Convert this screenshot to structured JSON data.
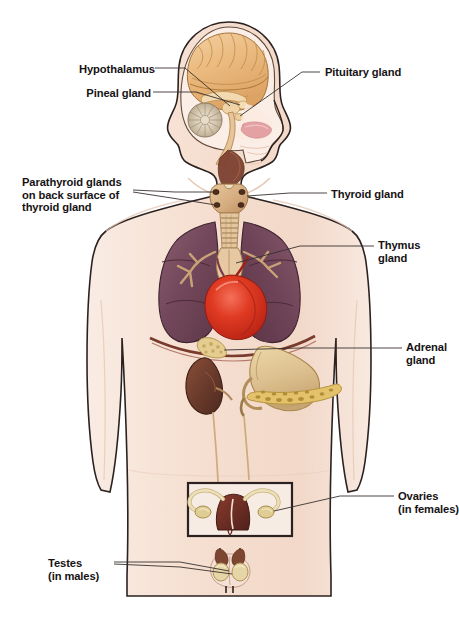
{
  "figure": {
    "background_color": "#ffffff",
    "body_fill": "#f6e2d6",
    "body_outline": "#2b2220",
    "leader_line_color": "#39312f",
    "label_color": "#161214"
  },
  "labels": [
    {
      "name": "hypothalamus",
      "text": "Hypothalamus",
      "side": "left",
      "x": 79,
      "y": 63,
      "width": 72,
      "align": "right"
    },
    {
      "name": "pineal-gland",
      "text": "Pineal gland",
      "side": "left",
      "x": 76,
      "y": 87,
      "width": 75,
      "align": "right"
    },
    {
      "name": "pituitary-gland",
      "text": "Pituitary gland",
      "side": "right",
      "x": 325,
      "y": 66,
      "width": 92,
      "align": "left"
    },
    {
      "name": "parathyroid-glands",
      "text": "Parathyroid glands\non back surface of\nthyroid gland",
      "side": "left",
      "x": 22,
      "y": 176,
      "width": 108,
      "align": "left"
    },
    {
      "name": "thyroid-gland",
      "text": "Thyroid gland",
      "side": "right",
      "x": 331,
      "y": 188,
      "width": 90,
      "align": "left"
    },
    {
      "name": "thymus-gland",
      "text": "Thymus\ngland",
      "side": "right",
      "x": 378,
      "y": 239,
      "width": 52,
      "align": "left"
    },
    {
      "name": "adrenal-gland",
      "text": "Adrenal\ngland",
      "side": "right",
      "x": 406,
      "y": 341,
      "width": 50,
      "align": "left"
    },
    {
      "name": "ovaries",
      "text": "Ovaries\n(in females)",
      "side": "right",
      "x": 398,
      "y": 490,
      "width": 61,
      "align": "left"
    },
    {
      "name": "testes",
      "text": "Testes\n(in males)",
      "side": "left",
      "x": 48,
      "y": 557,
      "width": 62,
      "align": "left"
    }
  ],
  "organs": [
    {
      "name": "brain-cerebrum",
      "label": "Cerebrum",
      "color": "#edb97f"
    },
    {
      "name": "brain-cerebellum",
      "label": "Cerebellum",
      "color": "#d9cdb8"
    },
    {
      "name": "brainstem",
      "label": "Brain stem",
      "color": "#e8c49a"
    },
    {
      "name": "nasal-cavity",
      "label": "Nasal cavity",
      "color": "#e8a8a8"
    },
    {
      "name": "thyroid-gland-organ",
      "label": "Thyroid gland",
      "color": "#d9b184"
    },
    {
      "name": "parathyroid-glands-organ",
      "label": "Parathyroid glands",
      "color": "#5c3b2a"
    },
    {
      "name": "trachea",
      "label": "Trachea",
      "color": "#e2c49e"
    },
    {
      "name": "lung-left",
      "label": "Left lung",
      "color": "#74485c"
    },
    {
      "name": "lung-right",
      "label": "Right lung",
      "color": "#6e4357"
    },
    {
      "name": "heart",
      "label": "Heart",
      "color": "#d62f1e"
    },
    {
      "name": "thymus-gland-organ",
      "label": "Thymus gland",
      "color": "#e2c49e"
    },
    {
      "name": "bronchi",
      "label": "Bronchi",
      "color": "#c8a178"
    },
    {
      "name": "diaphragm",
      "label": "Diaphragm",
      "color": "#7a3a2c"
    },
    {
      "name": "stomach",
      "label": "Stomach",
      "color": "#ddc08f"
    },
    {
      "name": "pancreas",
      "label": "Pancreas",
      "color": "#e2c068"
    },
    {
      "name": "kidney",
      "label": "Kidney",
      "color": "#6b3b2c"
    },
    {
      "name": "adrenal-gland-organ",
      "label": "Adrenal gland",
      "color": "#e3ca8e"
    },
    {
      "name": "ureter",
      "label": "Ureter",
      "color": "#cdab7e"
    },
    {
      "name": "uterus",
      "label": "Uterus",
      "color": "#6d2e25"
    },
    {
      "name": "fallopian-tubes",
      "label": "Fallopian tubes",
      "color": "#e6d6ae"
    },
    {
      "name": "ovary-organ",
      "label": "Ovary",
      "color": "#e0cd96"
    },
    {
      "name": "testis-organ",
      "label": "Testis",
      "color": "#e4d3a4"
    },
    {
      "name": "epididymis",
      "label": "Epididymis",
      "color": "#7d4630"
    },
    {
      "name": "scrotum",
      "label": "Scrotum",
      "color": "#f2ded2"
    }
  ]
}
